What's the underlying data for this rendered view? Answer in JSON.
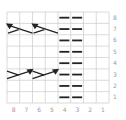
{
  "chart": {
    "title": "",
    "columns": 8,
    "rows": 8,
    "col_labels": [
      "8",
      "7",
      "6",
      "5",
      "4",
      "3",
      "2",
      "1"
    ],
    "row_labels": [
      "8",
      "7",
      "6",
      "5",
      "4",
      "3",
      "2",
      "1"
    ],
    "grid_color": "#d0d0d0",
    "symbol_color": "#222222",
    "label_color": "#9a9a9a"
  },
  "stitches": {
    "purl_columns": [
      4,
      3
    ],
    "purl_rows": [
      1,
      2,
      3,
      4,
      5,
      6,
      7,
      8
    ],
    "cables": [
      {
        "row": 7,
        "columns": [
          8,
          7
        ],
        "direction": "left",
        "symbol": "left-cross-cable"
      },
      {
        "row": 7,
        "columns": [
          6,
          5
        ],
        "direction": "left",
        "symbol": "left-cross-cable"
      },
      {
        "row": 3,
        "columns": [
          8,
          7
        ],
        "direction": "right",
        "symbol": "right-cross-cable"
      },
      {
        "row": 3,
        "columns": [
          6,
          5
        ],
        "direction": "right",
        "symbol": "right-cross-cable"
      }
    ]
  }
}
